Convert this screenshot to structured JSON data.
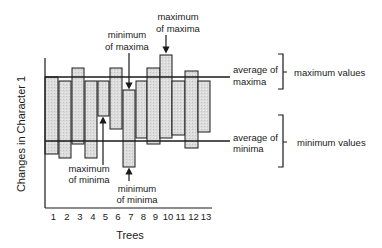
{
  "diagram": {
    "y_axis_label": "Changes in Character 1",
    "x_axis_label": "Trees",
    "tree_labels": [
      "1",
      "2",
      "3",
      "4",
      "5",
      "6",
      "7",
      "8",
      "9",
      "10",
      "11",
      "12",
      "13"
    ],
    "colors": {
      "bar_fill": "#d9d9d9",
      "stroke": "#1a1a1a"
    },
    "annotations": {
      "max_of_maxima": [
        "maximum",
        "of maxima"
      ],
      "min_of_maxima": [
        "minimum",
        "of maxima"
      ],
      "max_of_minima": [
        "maximum",
        "of minima"
      ],
      "min_of_minima": [
        "minimum",
        "of minima"
      ],
      "avg_of_maxima": [
        "average of",
        "maxima"
      ],
      "avg_of_minima": [
        "average of",
        "minima"
      ],
      "maximum_values": "maximum values",
      "minimum_values": "minimum values"
    }
  },
  "chart_data": {
    "type": "bar",
    "subtype": "floating-range",
    "title": "",
    "xlabel": "Trees",
    "ylabel": "Changes in Character 1",
    "categories": [
      "1",
      "2",
      "3",
      "4",
      "5",
      "6",
      "7",
      "8",
      "9",
      "10",
      "11",
      "12",
      "13"
    ],
    "series": [
      {
        "name": "maximum",
        "values_px_top": [
          77,
          81,
          68,
          81,
          81,
          68,
          90,
          81,
          68,
          55,
          81,
          71,
          81
        ]
      },
      {
        "name": "minimum",
        "values_px_bottom": [
          154,
          158,
          144,
          158,
          116,
          129,
          167,
          138,
          144,
          138,
          135,
          148,
          132
        ]
      }
    ],
    "reference_lines": [
      {
        "name": "average of maxima",
        "y_px": 77
      },
      {
        "name": "average of minima",
        "y_px": 141
      }
    ],
    "grid": false,
    "legend": "none"
  }
}
